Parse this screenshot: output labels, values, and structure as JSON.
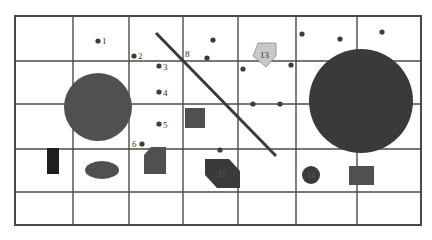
{
  "colors": {
    "background": "#ffffff",
    "grid": "#4a4a4a",
    "dark_fill": "#3a3a3a",
    "mid_fill": "#505050",
    "light_fill": "#c8c8c8",
    "black_fill": "#1e1e1e",
    "dot": "#3c3c3c"
  },
  "grid": {
    "x": 15,
    "y": 16,
    "width": 406,
    "height": 209,
    "columns": [
      15,
      73,
      129,
      183,
      238,
      296,
      357,
      421
    ],
    "rows": [
      16,
      61,
      104,
      149,
      192,
      225
    ]
  },
  "labeled_dots": [
    {
      "label": "1",
      "x": 98,
      "y": 41,
      "lx": 102,
      "ly": 44
    },
    {
      "label": "2",
      "x": 134,
      "y": 56,
      "lx": 138,
      "ly": 59
    },
    {
      "label": "3",
      "x": 159,
      "y": 66,
      "lx": 163,
      "ly": 70
    },
    {
      "label": "4",
      "x": 159,
      "y": 92,
      "lx": 163,
      "ly": 96
    },
    {
      "label": "5",
      "x": 159,
      "y": 124,
      "lx": 163,
      "ly": 128
    },
    {
      "label": "6",
      "x": 142,
      "y": 144,
      "lx": 132,
      "ly": 147
    }
  ],
  "plain_dots": [
    {
      "x": 213,
      "y": 40
    },
    {
      "x": 207,
      "y": 58
    },
    {
      "x": 243,
      "y": 69
    },
    {
      "x": 291,
      "y": 65
    },
    {
      "x": 302,
      "y": 34
    },
    {
      "x": 340,
      "y": 39
    },
    {
      "x": 382,
      "y": 32
    },
    {
      "x": 253,
      "y": 104
    },
    {
      "x": 280,
      "y": 104
    },
    {
      "x": 220,
      "y": 150
    }
  ],
  "line8": {
    "label": "8",
    "x1": 156,
    "y1": 33,
    "x2": 276,
    "y2": 156,
    "lx": 185,
    "ly": 57
  },
  "shapes": {
    "circle7": {
      "label": "7",
      "cx": 98,
      "cy": 107,
      "r": 34
    },
    "big_circle": {
      "label": "",
      "cx": 361,
      "cy": 101,
      "r": 52
    },
    "ellipse9": {
      "label": "9",
      "cx": 102,
      "cy": 170,
      "rx": 17,
      "ry": 9
    },
    "rect_black": {
      "label": "",
      "x": 47,
      "y": 148,
      "w": 12,
      "h": 26
    },
    "pent10": {
      "label": "10",
      "points": "151,147 166,147 166,174 144,174 144,155",
      "lx": 150,
      "ly": 165
    },
    "square12": {
      "label": "12",
      "x": 185,
      "y": 108,
      "w": 20,
      "h": 20,
      "lx": 190,
      "ly": 121
    },
    "hex11": {
      "label": "11",
      "points": "205,159 229,159 240,171 240,188 217,188 205,175",
      "lx": 218,
      "ly": 177
    },
    "pent13": {
      "label": "13",
      "points": "258,43 276,43 276,56 266,67 253,56",
      "lx": 260,
      "ly": 58
    },
    "circle14": {
      "label": "14",
      "cx": 311,
      "cy": 175,
      "r": 9
    },
    "square15": {
      "label": "15",
      "x": 349,
      "y": 166,
      "w": 25,
      "h": 19,
      "lx": 357,
      "ly": 179
    }
  }
}
